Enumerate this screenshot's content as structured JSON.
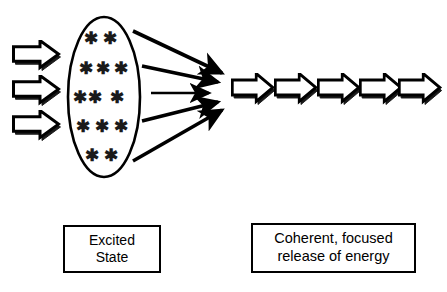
{
  "figure": {
    "background_color": "#ffffff",
    "stroke_color": "#000000",
    "width": 447,
    "height": 292
  },
  "input_arrows": {
    "name": "incoming-energy-arrows",
    "count": 3,
    "direction": "right",
    "style": "block-arrow-outline-with-shadow",
    "items": [
      {
        "index": 1,
        "x": 12,
        "y": 41,
        "width": 46,
        "height": 28
      },
      {
        "index": 2,
        "x": 12,
        "y": 76,
        "width": 46,
        "height": 28
      },
      {
        "index": 3,
        "x": 12,
        "y": 111,
        "width": 46,
        "height": 28
      }
    ]
  },
  "excited_medium": {
    "name": "excited-state-ellipse",
    "shape": "ellipse",
    "cx": 104,
    "cy": 97,
    "rx": 36,
    "ry": 80,
    "excited_particle_glyph": "asterisk",
    "excited_particle_count": 13,
    "excited_particle_rows": [
      2,
      3,
      3,
      3,
      2
    ],
    "particles": [
      {
        "x": 91,
        "y": 38
      },
      {
        "x": 110,
        "y": 38
      },
      {
        "x": 86,
        "y": 68
      },
      {
        "x": 103,
        "y": 68
      },
      {
        "x": 121,
        "y": 68
      },
      {
        "x": 80,
        "y": 97
      },
      {
        "x": 95,
        "y": 97
      },
      {
        "x": 117,
        "y": 97
      },
      {
        "x": 83,
        "y": 126
      },
      {
        "x": 102,
        "y": 126
      },
      {
        "x": 121,
        "y": 126
      },
      {
        "x": 92,
        "y": 155
      },
      {
        "x": 111,
        "y": 155
      }
    ]
  },
  "converging_arrows": {
    "name": "converging-emission-arrows",
    "count": 5,
    "focal_point": {
      "x": 227,
      "y": 88
    },
    "items": [
      {
        "index": 1,
        "x1": 133,
        "y1": 31,
        "x2": 229,
        "y2": 76
      },
      {
        "index": 2,
        "x1": 142,
        "y1": 67,
        "x2": 226,
        "y2": 85
      },
      {
        "index": 3,
        "x1": 151,
        "y1": 93,
        "x2": 218,
        "y2": 93
      },
      {
        "index": 4,
        "x1": 142,
        "y1": 120,
        "x2": 226,
        "y2": 99
      },
      {
        "index": 5,
        "x1": 133,
        "y1": 160,
        "x2": 229,
        "y2": 108
      }
    ]
  },
  "output_arrows": {
    "name": "coherent-beam-arrows",
    "count": 5,
    "direction": "right",
    "style": "block-arrow-outline-with-shadow",
    "items": [
      {
        "index": 1,
        "x": 232,
        "y": 74,
        "width": 41,
        "height": 30
      },
      {
        "index": 2,
        "x": 275,
        "y": 74,
        "width": 41,
        "height": 30
      },
      {
        "index": 3,
        "x": 318,
        "y": 74,
        "width": 41,
        "height": 30
      },
      {
        "index": 4,
        "x": 361,
        "y": 74,
        "width": 41,
        "height": 30
      },
      {
        "index": 5,
        "x": 400,
        "y": 74,
        "width": 41,
        "height": 30
      }
    ]
  },
  "labels": {
    "excited_state": {
      "name": "excited-state-label",
      "text": "Excited\nState",
      "line1": "Excited",
      "line2": "State"
    },
    "coherent_release": {
      "name": "coherent-release-label",
      "text": "Coherent, focused\nrelease of energy",
      "line1": "Coherent, focused",
      "line2": "release of energy"
    }
  }
}
